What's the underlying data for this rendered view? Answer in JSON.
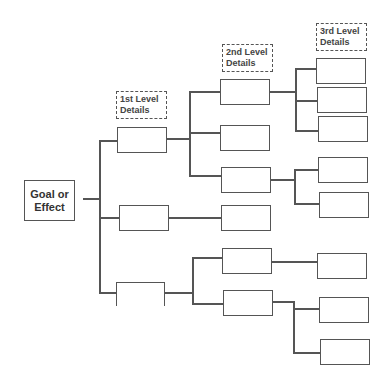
{
  "root": {
    "line1": "Goal or",
    "line2": "Effect"
  },
  "labels": {
    "level1": {
      "line1": "1st Level",
      "line2": "Details"
    },
    "level2": {
      "line1": "2nd Level",
      "line2": "Details"
    },
    "level3": {
      "line1": "3rd Level",
      "line2": "Details"
    }
  },
  "colors": {
    "line": "#555555",
    "text": "#444444",
    "background": "#ffffff"
  }
}
